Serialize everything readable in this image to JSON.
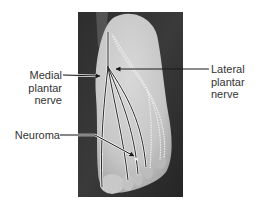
{
  "figure": {
    "labels": {
      "medial_plantar_nerve": {
        "lines": [
          "Medial",
          "plantar",
          "nerve"
        ]
      },
      "lateral_plantar_nerve": {
        "lines": [
          "Lateral",
          "plantar",
          "nerve"
        ]
      },
      "neuroma": {
        "lines": [
          "Neuroma"
        ]
      }
    },
    "colors": {
      "background": "#ffffff",
      "photo_background": "#2a2a2a",
      "skin": "#c9c9c9",
      "nerve_dark": "#2b2b2b",
      "nerve_light": "#eeeeee",
      "label_text": "#333333",
      "leader_line": "#1a1a1a"
    }
  }
}
